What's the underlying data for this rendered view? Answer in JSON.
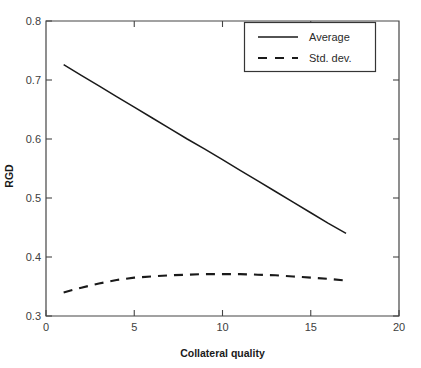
{
  "chart_data": {
    "type": "line",
    "title": "",
    "subtitle": "",
    "xlabel": "Collateral quality",
    "ylabel": "RGD",
    "xlim": [
      0,
      20
    ],
    "ylim": [
      0.3,
      0.8
    ],
    "xticks": [
      "0",
      "5",
      "10",
      "15",
      "20"
    ],
    "xtick_values": [
      0,
      5,
      10,
      15,
      20
    ],
    "yticks": [
      "0.3",
      "0.4",
      "0.5",
      "0.6",
      "0.7",
      "0.8"
    ],
    "ytick_values": [
      0.3,
      0.4,
      0.5,
      0.6,
      0.7,
      0.8
    ],
    "grid": false,
    "legend_position": "top-right",
    "x": [
      1,
      2,
      3,
      4,
      5,
      6,
      7,
      8,
      9,
      10,
      11,
      12,
      13,
      14,
      15,
      16,
      17
    ],
    "series": [
      {
        "name": "Average",
        "style": "solid",
        "color": "#1a1a1a",
        "values": [
          0.726,
          0.708,
          0.69,
          0.672,
          0.654,
          0.636,
          0.618,
          0.6,
          0.583,
          0.565,
          0.547,
          0.529,
          0.511,
          0.493,
          0.475,
          0.457,
          0.44
        ]
      },
      {
        "name": "Std. dev.",
        "style": "dashed",
        "color": "#1a1a1a",
        "values": [
          0.34,
          0.348,
          0.355,
          0.361,
          0.365,
          0.367,
          0.369,
          0.37,
          0.371,
          0.371,
          0.371,
          0.37,
          0.369,
          0.367,
          0.365,
          0.363,
          0.36
        ]
      }
    ],
    "annotations": []
  },
  "legend": {
    "entries": [
      {
        "label": "Average"
      },
      {
        "label": "Std. dev."
      }
    ]
  },
  "axes": {
    "x_title": "Collateral quality",
    "y_title": "RGD",
    "x_tick_labels": [
      "0",
      "5",
      "10",
      "15",
      "20"
    ],
    "y_tick_labels": [
      "0.3",
      "0.4",
      "0.5",
      "0.6",
      "0.7",
      "0.8"
    ]
  },
  "colors": {
    "frame": "#454545",
    "series": "#1a1a1a",
    "background": "#ffffff",
    "tick_text": "#404040"
  }
}
